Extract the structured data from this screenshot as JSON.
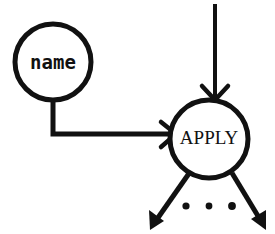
{
  "canvas": {
    "width": 275,
    "height": 234,
    "background_color": "#ffffff",
    "ink_color": "#111111"
  },
  "diagram": {
    "kind": "node-and-arrow graph",
    "nodes": [
      {
        "id": "name",
        "label": "name",
        "shape": "circle",
        "cx": 53,
        "cy": 62,
        "r": 38,
        "stroke_width": 5,
        "font_size": 19,
        "font_style": "monospace",
        "fill": "#ffffff",
        "stroke": "#111111"
      },
      {
        "id": "apply",
        "label": "APPLY",
        "shape": "circle",
        "cx": 209,
        "cy": 139,
        "r": 39,
        "stroke_width": 5,
        "font_size": 19,
        "font_style": "serif",
        "fill": "#ffffff",
        "stroke": "#111111"
      }
    ],
    "edges": [
      {
        "id": "incoming-top",
        "from": "top-of-frame",
        "to": "apply",
        "style": "straight-vertical",
        "arrowhead": "open-v",
        "path": "M 215 4 L 215 97",
        "stroke_width": 4
      },
      {
        "id": "name-to-apply",
        "from": "name",
        "to": "apply",
        "style": "elbow",
        "arrowhead": "open-v",
        "path": "M 53 100 L 53 134 L 174 134",
        "stroke_width": 5
      },
      {
        "id": "outgoing-left",
        "from": "apply",
        "to": "unspecified",
        "style": "straight-diagonal",
        "arrowhead": "solid",
        "path": "M 188 173 L 152 224",
        "stroke_width": 5
      },
      {
        "id": "outgoing-right",
        "from": "apply",
        "to": "unspecified",
        "style": "straight-diagonal",
        "arrowhead": "solid",
        "path": "M 234 174 L 264 224",
        "stroke_width": 5
      }
    ],
    "ellipsis": {
      "symbol": "...",
      "meaning": "additional outgoing arrows elided",
      "dot_radius": 3.6,
      "dots": [
        {
          "cx": 186,
          "cy": 206
        },
        {
          "cx": 209,
          "cy": 206
        },
        {
          "cx": 232,
          "cy": 206
        }
      ]
    }
  }
}
